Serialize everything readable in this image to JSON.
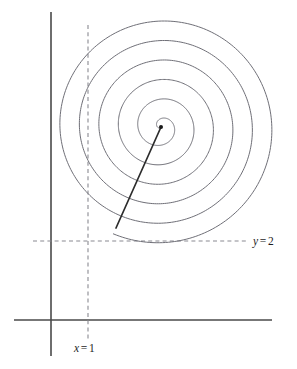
{
  "figure": {
    "background_color": "#ffffff",
    "width": 297,
    "height": 369
  },
  "labels": {
    "y_line": {
      "variable": "y",
      "operator": "=",
      "value": "2",
      "full_text": "y = 2",
      "color": "#1d1d1d"
    },
    "x_line": {
      "variable": "x",
      "operator": "=",
      "value": "1",
      "full_text": "x = 1",
      "color": "#1d1d1d"
    }
  },
  "chart_data": {
    "type": "line",
    "title": "",
    "xlabel": "",
    "ylabel": "",
    "grid": false,
    "legend": null,
    "annotations": [
      {
        "name": "y-reference-label",
        "text": "y = 2",
        "x_px": 253,
        "y_px": 243
      },
      {
        "name": "x-reference-label",
        "text": "x = 1",
        "x_px": 74,
        "y_px": 350
      }
    ],
    "axes": {
      "vertical_axis": {
        "x_px": 51,
        "y_top_px": 12,
        "y_bottom_px": 356,
        "color": "#4a4a4a"
      },
      "horizontal_axis": {
        "y_px": 320,
        "x_left_px": 14,
        "x_right_px": 272,
        "color": "#4a4a4a"
      }
    },
    "reference_lines": [
      {
        "name": "y-equals-2",
        "orientation": "horizontal",
        "value": 2,
        "y_px": 241,
        "x_start_px": 33,
        "x_end_px": 248,
        "style": "dashed",
        "color": "#8a8a92"
      },
      {
        "name": "x-equals-1",
        "orientation": "vertical",
        "value": 1,
        "x_px": 88,
        "y_start_px": 25,
        "y_end_px": 341,
        "style": "dashed",
        "color": "#8a8a92"
      }
    ],
    "spiral": {
      "kind": "archimedean",
      "center_px": {
        "x": 161,
        "y": 127
      },
      "turns": 6,
      "start_angle_deg": 127,
      "max_radius_px": 117,
      "direction": "counterclockwise-outward",
      "color": "#6f6f77",
      "crossings_above_center_y_px": [
        13,
        35,
        57,
        78,
        98,
        113
      ],
      "crossings_below_center_y_px": [
        141,
        158,
        177,
        197,
        218,
        240
      ]
    },
    "radius_segment": {
      "name": "center-to-spiral-start",
      "from_px": {
        "x": 161,
        "y": 127
      },
      "to_px": {
        "x": 116,
        "y": 228
      },
      "color": "#2c2c2c"
    },
    "center_point": {
      "x_px": 161,
      "y_px": 127,
      "color": "#1a1a1a",
      "radius_px": 2
    }
  }
}
